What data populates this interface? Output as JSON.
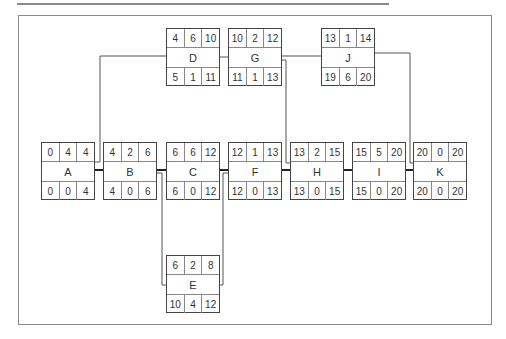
{
  "diagram": {
    "type": "activity-on-node network",
    "legend_layout": "top: ES, duration, EF / bottom: LS, float, LF",
    "nodes": [
      {
        "id": "A",
        "es": "0",
        "dur": "4",
        "ef": "4",
        "ls": "0",
        "fl": "0",
        "lf": "4"
      },
      {
        "id": "B",
        "es": "4",
        "dur": "2",
        "ef": "6",
        "ls": "4",
        "fl": "0",
        "lf": "6"
      },
      {
        "id": "C",
        "es": "6",
        "dur": "6",
        "ef": "12",
        "ls": "6",
        "fl": "0",
        "lf": "12"
      },
      {
        "id": "D",
        "es": "4",
        "dur": "6",
        "ef": "10",
        "ls": "5",
        "fl": "1",
        "lf": "11"
      },
      {
        "id": "E",
        "es": "6",
        "dur": "2",
        "ef": "8",
        "ls": "10",
        "fl": "4",
        "lf": "12"
      },
      {
        "id": "F",
        "es": "12",
        "dur": "1",
        "ef": "13",
        "ls": "12",
        "fl": "0",
        "lf": "13"
      },
      {
        "id": "G",
        "es": "10",
        "dur": "2",
        "ef": "12",
        "ls": "11",
        "fl": "1",
        "lf": "13"
      },
      {
        "id": "H",
        "es": "13",
        "dur": "2",
        "ef": "15",
        "ls": "13",
        "fl": "0",
        "lf": "15"
      },
      {
        "id": "I",
        "es": "15",
        "dur": "5",
        "ef": "20",
        "ls": "15",
        "fl": "0",
        "lf": "20"
      },
      {
        "id": "J",
        "es": "13",
        "dur": "1",
        "ef": "14",
        "ls": "19",
        "fl": "6",
        "lf": "20"
      },
      {
        "id": "K",
        "es": "20",
        "dur": "0",
        "ef": "20",
        "ls": "20",
        "fl": "0",
        "lf": "20"
      }
    ],
    "edges": [
      {
        "from": "A",
        "to": "B",
        "critical": true
      },
      {
        "from": "A",
        "to": "D",
        "critical": false
      },
      {
        "from": "B",
        "to": "C",
        "critical": true
      },
      {
        "from": "B",
        "to": "E",
        "critical": false
      },
      {
        "from": "C",
        "to": "F",
        "critical": true
      },
      {
        "from": "E",
        "to": "F",
        "critical": false
      },
      {
        "from": "D",
        "to": "G",
        "critical": false
      },
      {
        "from": "F",
        "to": "H",
        "critical": true
      },
      {
        "from": "G",
        "to": "H",
        "critical": false
      },
      {
        "from": "G",
        "to": "J",
        "critical": false
      },
      {
        "from": "H",
        "to": "I",
        "critical": true
      },
      {
        "from": "I",
        "to": "K",
        "critical": true
      },
      {
        "from": "J",
        "to": "K",
        "critical": false
      }
    ],
    "colors": {
      "line": "#444444",
      "critical_line": "#222222",
      "frame": "#8a8a8a"
    }
  }
}
